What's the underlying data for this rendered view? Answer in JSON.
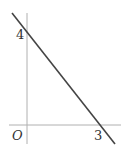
{
  "diagram": {
    "type": "coordinate-line-graph",
    "origin_label": "O",
    "y_intercept_label": "4",
    "x_intercept_label": "3",
    "line": {
      "x_intercept": 3,
      "y_intercept": 4
    },
    "colors": {
      "axis": "#b0b0b0",
      "line": "#444444",
      "text": "#333333"
    }
  }
}
